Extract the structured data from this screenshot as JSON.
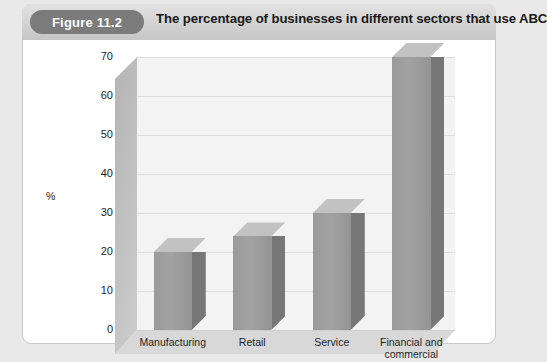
{
  "figure": {
    "badge": "Figure 11.2",
    "title": "The percentage of businesses in different sectors that use ABC"
  },
  "colors": {
    "badge_bg": "#7b7b7b",
    "header_bg": "#d4d4d4",
    "bar_front": "#9c9c9c",
    "bar_side": "#777777",
    "bar_top": "#c2c2c2",
    "back_wall": "#f3f3f3",
    "side_wall": "#c0c0c0",
    "floor": "#d8d8d8"
  },
  "chart_data": {
    "type": "bar",
    "title": "The percentage of businesses in different sectors that use ABC",
    "categories": [
      "Manufacturing",
      "Retail",
      "Service",
      "Financial and commercial"
    ],
    "values": [
      20,
      24,
      30,
      70
    ],
    "xlabel": "",
    "ylabel": "%",
    "ylim": [
      0,
      70
    ],
    "yticks": [
      0,
      10,
      20,
      30,
      40,
      50,
      60,
      70
    ],
    "ytick_labels": [
      "0",
      "10",
      "20",
      "30",
      "40",
      "50",
      "60",
      "70"
    ],
    "grid": true,
    "legend": false,
    "style_3d": true
  }
}
